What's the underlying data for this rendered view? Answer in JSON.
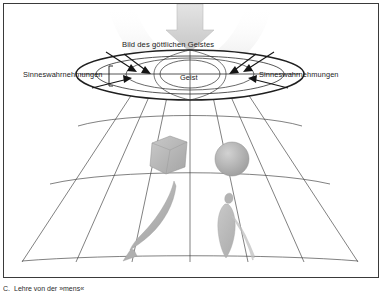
{
  "figure": {
    "title_label": "Bild des göttlichen Geistes",
    "center_label": "Geist",
    "sense_label_left": "Sinneswahrnehmungen",
    "sense_label_right": "Sinneswahrnehmungen",
    "objects": [
      {
        "name": "cube",
        "label": "Würfel"
      },
      {
        "name": "sphere",
        "label": "Kugel"
      },
      {
        "name": "fish",
        "label": "Fisch"
      },
      {
        "name": "human",
        "label": "Mensch"
      }
    ],
    "colors": {
      "frame": "#3a3a3a",
      "line": "#2a2a2a",
      "grid": "#4a4a4a",
      "arrow_fill": "#cfcfcf",
      "object_fill": "#b8b8b8",
      "text": "#1a1a1a",
      "background": "#ffffff"
    }
  },
  "caption": {
    "marker": "C.",
    "text": "Lehre von der »mens«"
  }
}
